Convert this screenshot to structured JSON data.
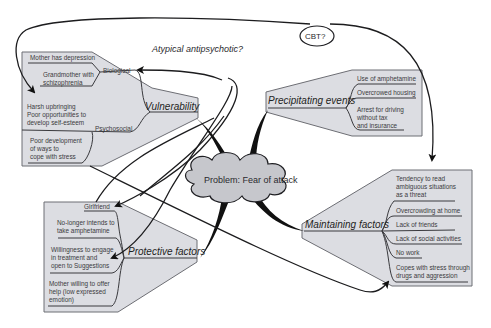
{
  "diagram": {
    "center": {
      "label": "Problem: Fear of attack"
    },
    "annotations": {
      "top_note": "Atypical antipsychotic?",
      "bubble": "CBT?"
    },
    "vulnerability": {
      "title": "Vulnerability",
      "biological": {
        "label": "Biological",
        "items": [
          "Mother has depression",
          "Grandmother with",
          "schizophrenia"
        ]
      },
      "psychosocial": {
        "label": "Psychosocial",
        "items": [
          "Harsh upbringing",
          "Poor opportunities to",
          "develop self-esteem",
          "Poor development",
          "of ways to",
          "cope with stress"
        ]
      }
    },
    "precipitating": {
      "title": "Precipitating events",
      "items": [
        "Use of amphetamine",
        "Overcrowed housing",
        "Arrest for driving",
        "without tax",
        "and insurance"
      ]
    },
    "protective": {
      "title": "Protective factors",
      "items": [
        "Girlfriend",
        "No-longer intends to",
        "take amphetamine",
        "Willingness to engage",
        "in treatment and",
        "open to Suggestions",
        "Mother willing to offer",
        "help (low expressed",
        "emotion)"
      ]
    },
    "maintaining": {
      "title": "Maintaining factors",
      "items": [
        "Tendency to read",
        "ambiguous situations",
        "as a threat",
        "Overcrowding at home",
        "Lack of friends",
        "Lack of social activities",
        "No work",
        "Copes with stress through",
        "drugs and aggression"
      ]
    },
    "colors": {
      "panel_fill": "#dcdde2",
      "panel_stroke": "#6d6e74",
      "ink": "#1f1f23",
      "background": "#ffffff"
    }
  }
}
